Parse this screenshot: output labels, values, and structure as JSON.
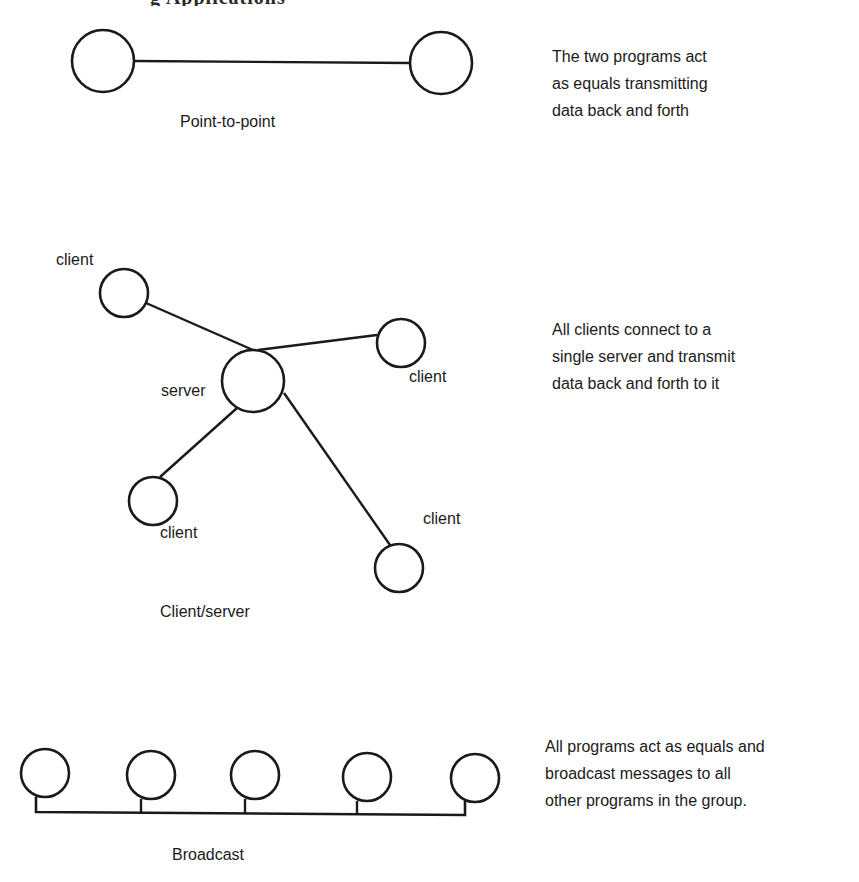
{
  "header": {
    "cut_off_title_fragment": "g Applications"
  },
  "diagrams": {
    "point_to_point": {
      "caption": "Point-to-point",
      "description_lines": [
        "The two programs act",
        "as equals transmitting",
        "data back and forth"
      ],
      "nodes": [
        {
          "id": "p1",
          "cx": 103,
          "cy": 61,
          "r": 31
        },
        {
          "id": "p2",
          "cx": 441,
          "cy": 63,
          "r": 31
        }
      ],
      "links": [
        {
          "from": "p1",
          "to": "p2"
        }
      ]
    },
    "client_server": {
      "caption": "Client/server",
      "description_lines": [
        "All clients connect to a",
        "single server and transmit",
        "data back and forth to it"
      ],
      "labels": {
        "server": "server",
        "client_top_left": "client",
        "client_right": "client",
        "client_bottom_left": "client",
        "client_bottom_right": "client"
      },
      "nodes": [
        {
          "id": "server",
          "role": "server",
          "cx": 253,
          "cy": 381,
          "r": 31
        },
        {
          "id": "c1",
          "role": "client",
          "cx": 124,
          "cy": 293,
          "r": 24
        },
        {
          "id": "c2",
          "role": "client",
          "cx": 401,
          "cy": 343,
          "r": 24
        },
        {
          "id": "c3",
          "role": "client",
          "cx": 153,
          "cy": 501,
          "r": 24
        },
        {
          "id": "c4",
          "role": "client",
          "cx": 399,
          "cy": 568,
          "r": 24
        }
      ],
      "links": [
        {
          "from": "c1",
          "to": "server"
        },
        {
          "from": "c2",
          "to": "server"
        },
        {
          "from": "c3",
          "to": "server"
        },
        {
          "from": "c4",
          "to": "server"
        }
      ]
    },
    "broadcast": {
      "caption": "Broadcast",
      "description_lines": [
        "All programs act as equals and",
        "broadcast messages to all",
        "other programs in the group."
      ],
      "node_count": 5,
      "nodes": [
        {
          "id": "b1",
          "cx": 45,
          "cy": 773,
          "r": 24
        },
        {
          "id": "b2",
          "cx": 151,
          "cy": 775,
          "r": 24
        },
        {
          "id": "b3",
          "cx": 255,
          "cy": 775,
          "r": 24
        },
        {
          "id": "b4",
          "cx": 367,
          "cy": 777,
          "r": 24
        },
        {
          "id": "b5",
          "cx": 475,
          "cy": 778,
          "r": 24
        }
      ]
    }
  },
  "colors": {
    "stroke": "#1a1a1a",
    "background": "#ffffff",
    "text": "#1a1a1a"
  }
}
